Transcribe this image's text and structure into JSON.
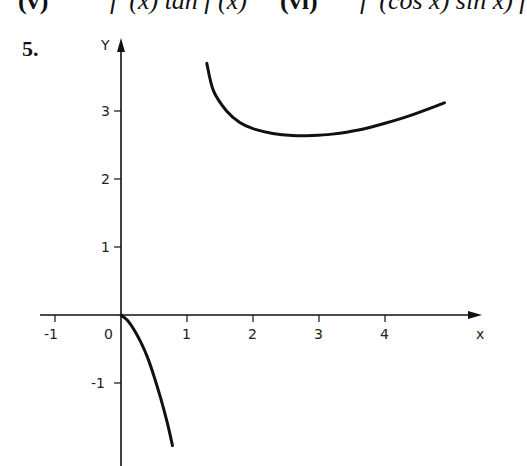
{
  "header": {
    "item_v_label": "(v)",
    "item_v_expr": "f '(x) tan f (x)",
    "item_vi_label": "(vi)",
    "item_vi_expr": "f '(cos x) sin x) f"
  },
  "question_number": "5.",
  "chart_data": {
    "type": "line",
    "title": "",
    "xlabel": "x",
    "ylabel": "y",
    "x_ticks": [
      "-1",
      "0",
      "1",
      "2",
      "3",
      "4"
    ],
    "y_ticks": [
      "3",
      "2",
      "1",
      "-1"
    ],
    "xlim": [
      -1.3,
      5.0
    ],
    "ylim": [
      -1.9,
      3.7
    ],
    "grid": false,
    "legend": null,
    "series": [
      {
        "name": "branch-right",
        "x": [
          1.3,
          1.4,
          1.6,
          1.8,
          2.0,
          2.3,
          2.6,
          2.9,
          3.2,
          3.6,
          4.0,
          4.4,
          4.9
        ],
        "y": [
          3.7,
          3.3,
          3.0,
          2.83,
          2.74,
          2.67,
          2.64,
          2.64,
          2.66,
          2.72,
          2.82,
          2.94,
          3.12
        ]
      },
      {
        "name": "branch-left",
        "x": [
          0.0,
          0.1,
          0.2,
          0.3,
          0.4,
          0.5,
          0.6,
          0.7,
          0.78
        ],
        "y": [
          0.0,
          -0.08,
          -0.22,
          -0.4,
          -0.62,
          -0.9,
          -1.22,
          -1.58,
          -1.92
        ]
      }
    ]
  }
}
